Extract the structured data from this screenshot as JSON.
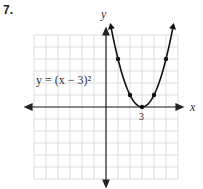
{
  "problem_number": "7.",
  "equation_label": "y = (x − 3)²",
  "axis_labels": {
    "x": "x",
    "y": "y"
  },
  "tick_labels": {
    "x_vertex": "3"
  },
  "chart_data": {
    "type": "line",
    "xlabel": "x",
    "ylabel": "y",
    "xlim": [
      -6,
      6
    ],
    "ylim": [
      -6,
      6
    ],
    "grid": true,
    "tick_labels": [
      "3"
    ],
    "series": [
      {
        "name": "y = (x − 3)^2",
        "x": [
          1,
          2,
          3,
          4,
          5
        ],
        "y": [
          4,
          1,
          0,
          1,
          4
        ]
      }
    ],
    "marked_points": [
      [
        1,
        4
      ],
      [
        2,
        1
      ],
      [
        3,
        0
      ],
      [
        4,
        1
      ],
      [
        5,
        4
      ]
    ],
    "annotations": [
      "y = (x − 3)^2",
      "3"
    ]
  }
}
